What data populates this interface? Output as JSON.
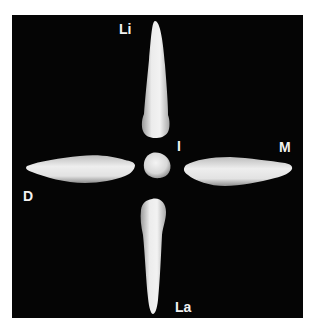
{
  "figure": {
    "background_color": "#050505",
    "tooth_color": "#e6e6e6",
    "labels": {
      "lingual": "Li",
      "incisal": "I",
      "mesial": "M",
      "distal": "D",
      "labial": "La"
    },
    "views": [
      {
        "name": "lingual-view",
        "position": "top"
      },
      {
        "name": "incisal-view",
        "position": "center"
      },
      {
        "name": "distal-view",
        "position": "left"
      },
      {
        "name": "mesial-view",
        "position": "right"
      },
      {
        "name": "labial-view",
        "position": "bottom"
      }
    ]
  }
}
